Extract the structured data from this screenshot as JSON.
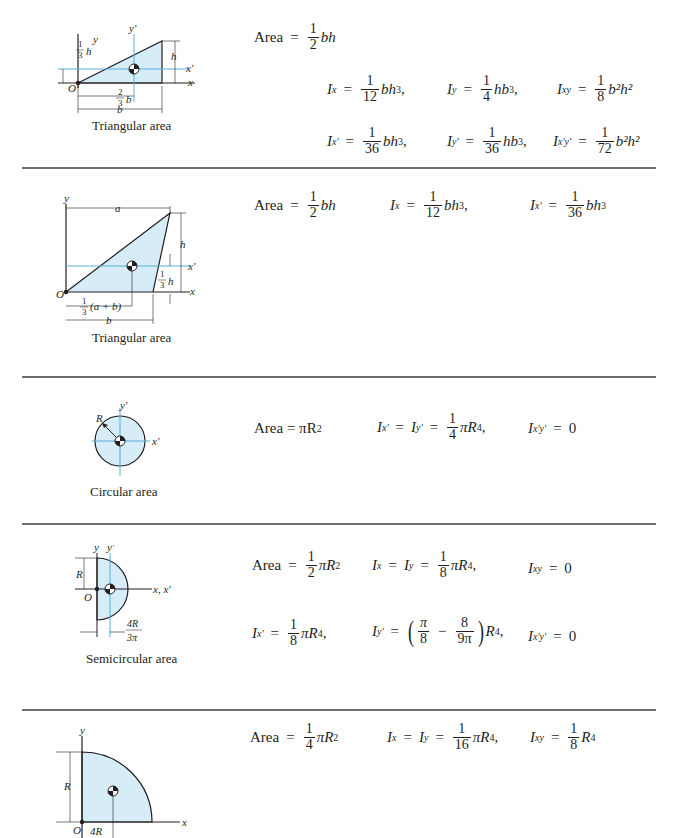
{
  "colors": {
    "fill": "#d6ecf6",
    "axis_blue": "#5aaed8",
    "rule": "#6d6d6d",
    "ink": "#231f20"
  },
  "sections": [
    {
      "caption": "Triangular area",
      "labels": {
        "y": "y",
        "yp": "y'",
        "x": "x",
        "xp": "x'",
        "O": "O",
        "h": "h",
        "b": "b",
        "one": "1",
        "two": "2",
        "three": "3"
      },
      "rows": [
        [
          {
            "lhs": "Area",
            "num": "1",
            "den": "2",
            "rhs": "bh"
          }
        ],
        [
          {
            "lhs": "I",
            "sub": "x",
            "num": "1",
            "den": "12",
            "rhs": "bh",
            "sup": "3",
            "tail": ","
          },
          {
            "lhs": "I",
            "sub": "y",
            "num": "1",
            "den": "4",
            "rhs": "hb",
            "sup": "3",
            "tail": ","
          },
          {
            "lhs": "I",
            "sub": "xy",
            "num": "1",
            "den": "8",
            "rhs": "b²h²",
            "sup": "",
            "tail": ""
          }
        ],
        [
          {
            "lhs": "I",
            "sub": "x'",
            "num": "1",
            "den": "36",
            "rhs": "bh",
            "sup": "3",
            "tail": ","
          },
          {
            "lhs": "I",
            "sub": "y'",
            "num": "1",
            "den": "36",
            "rhs": "hb",
            "sup": "3",
            "tail": ","
          },
          {
            "lhs": "I",
            "sub": "x'y'",
            "num": "1",
            "den": "72",
            "rhs": "b²h²",
            "sup": "",
            "tail": ""
          }
        ]
      ]
    },
    {
      "caption": "Triangular area",
      "labels": {
        "y": "y",
        "x": "x",
        "xp": "x'",
        "O": "O",
        "a": "a",
        "h": "h",
        "b": "b",
        "ab": "(a + b)",
        "one": "1",
        "three": "3"
      },
      "rows": [
        [
          {
            "lhs": "Area",
            "num": "1",
            "den": "2",
            "rhs": "bh"
          },
          {
            "lhs": "I",
            "sub": "x",
            "num": "1",
            "den": "12",
            "rhs": "bh",
            "sup": "3",
            "tail": ","
          },
          {
            "lhs": "I",
            "sub": "x'",
            "num": "1",
            "den": "36",
            "rhs": "bh",
            "sup": "3",
            "tail": ""
          }
        ]
      ]
    },
    {
      "caption": "Circular area",
      "labels": {
        "yp": "y'",
        "xp": "x'",
        "R": "R"
      },
      "rows": [
        [
          {
            "text": "Area = πR",
            "sup": "2"
          },
          {
            "lhs": "I",
            "sub": "x'",
            "mid": "I",
            "midsub": "y'",
            "num": "1",
            "den": "4",
            "rhs": "πR",
            "sup": "4",
            "tail": ","
          },
          {
            "lhs": "I",
            "sub": "x'y'",
            "value": "0"
          }
        ]
      ]
    },
    {
      "caption": "Semicircular area",
      "labels": {
        "y": "y",
        "yp": "y'",
        "xxp": "x, x'",
        "O": "O",
        "R": "R",
        "fnum": "4R",
        "fden": "3π"
      },
      "rows": [
        [
          {
            "lhs": "Area",
            "num": "1",
            "den": "2",
            "rhs": "πR",
            "sup": "2"
          },
          {
            "lhs": "I",
            "sub": "x",
            "mid": "I",
            "midsub": "y",
            "num": "1",
            "den": "8",
            "rhs": "πR",
            "sup": "4",
            "tail": ","
          },
          {
            "lhs": "I",
            "sub": "xy",
            "value": "0"
          }
        ],
        [
          {
            "lhs": "I",
            "sub": "x'",
            "num": "1",
            "den": "8",
            "rhs": "πR",
            "sup": "4",
            "tail": ","
          },
          {
            "lhs": "I",
            "sub": "y'",
            "p1num": "π",
            "p1den": "8",
            "minus": "−",
            "p2num": "8",
            "p2den": "9π",
            "rhs": "R",
            "sup": "4",
            "tail": ","
          },
          {
            "lhs": "I",
            "sub": "x'y'",
            "value": "0"
          }
        ]
      ]
    },
    {
      "caption": "",
      "labels": {
        "y": "y",
        "x": "x",
        "O": "O",
        "R": "R",
        "fnum": "4R"
      },
      "rows": [
        [
          {
            "lhs": "Area",
            "num": "1",
            "den": "4",
            "rhs": "πR",
            "sup": "2"
          },
          {
            "lhs": "I",
            "sub": "x",
            "mid": "I",
            "midsub": "y",
            "num": "1",
            "den": "16",
            "rhs": "πR",
            "sup": "4",
            "tail": ","
          },
          {
            "lhs": "I",
            "sub": "xy",
            "num": "1",
            "den": "8",
            "rhs": "R",
            "sup": "4",
            "tail": ""
          }
        ]
      ]
    }
  ]
}
